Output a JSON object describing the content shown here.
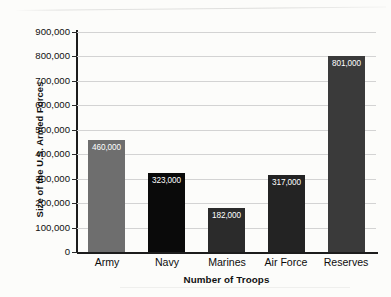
{
  "chart_data": {
    "type": "bar",
    "title": "",
    "categories": [
      "Army",
      "Navy",
      "Marines",
      "Air Force",
      "Reserves"
    ],
    "values": [
      460000,
      323000,
      182000,
      317000,
      801000
    ],
    "value_labels": [
      "460,000",
      "323,000",
      "182,000",
      "317,000",
      "801,000"
    ],
    "bar_colors": [
      "#6e6e6e",
      "#0a0a0a",
      "#2b2b2b",
      "#232323",
      "#3a3a3a"
    ],
    "xlabel": "Number of Troops",
    "ylabel": "Size of the U.S. Armed Forces",
    "ylim": [
      0,
      900000
    ],
    "ytick_values": [
      0,
      100000,
      200000,
      300000,
      400000,
      500000,
      600000,
      700000,
      800000,
      900000
    ],
    "ytick_labels": [
      "0",
      "100,000",
      "200,000",
      "300,000",
      "400,000",
      "500,000",
      "600,000",
      "700,000",
      "800,000",
      "900,000"
    ],
    "grid": "horizontal",
    "legend": "none",
    "background_color": "#fcfcfa",
    "gridline_color": "#d3d3d3",
    "axis_color": "#1c1c1c",
    "value_label_color": "#ffffff"
  }
}
